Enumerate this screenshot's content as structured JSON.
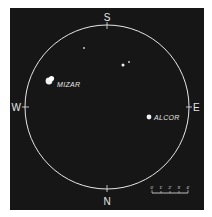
{
  "diagram": {
    "background_color": "#161616",
    "line_color": "#e6e6e6",
    "field_circle": {
      "cx": 107,
      "cy": 107,
      "r": 82
    },
    "compass": {
      "top": "S",
      "bottom": "N",
      "left": "W",
      "right": "E"
    },
    "stars": [
      {
        "name": "MIZAR",
        "label": "MIZAR",
        "x": 49,
        "y": 81,
        "r": 3.4
      },
      {
        "name": "MIZAR-B",
        "label": "",
        "x": 51,
        "y": 79,
        "r": 2.6
      },
      {
        "name": "ALCOR",
        "label": "ALCOR",
        "x": 149,
        "y": 117,
        "r": 2.4
      },
      {
        "name": "star-1",
        "label": "",
        "x": 84,
        "y": 48,
        "r": 0.9
      },
      {
        "name": "star-2",
        "label": "",
        "x": 123,
        "y": 65,
        "r": 1.5
      },
      {
        "name": "star-3",
        "label": "",
        "x": 129,
        "y": 62,
        "r": 0.9
      }
    ],
    "scale_bar": {
      "ticks": [
        "0'",
        "1'",
        "2'",
        "3'",
        "4'"
      ]
    }
  }
}
